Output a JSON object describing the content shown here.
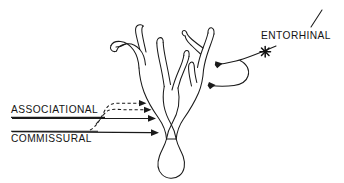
{
  "figure": {
    "background_color": "#ffffff",
    "ink_color": "#1a1a1a",
    "width": 344,
    "height": 183
  },
  "labels": {
    "associational": "ASSOCIATIONAL",
    "commissural": "COMMISSURAL",
    "entorhinal": "ENTORHINAL"
  },
  "diagram_data": {
    "type": "diagram",
    "subject": "neuron with dendritic tree and labeled afferent inputs",
    "cell_parts": [
      {
        "name": "soma",
        "description": "pear-shaped cell body at bottom center"
      },
      {
        "name": "apical-dendritic-tree",
        "description": "branching dendrites rising from soma, splitting into left and right primary branches with multiple bifurcations"
      }
    ],
    "afferents": [
      {
        "name": "associational",
        "label": "ASSOCIATIONAL",
        "side": "left",
        "line_style": "dashed-and-solid",
        "arrow_count": 3,
        "underline": true,
        "description": "dashed pathway plus solid pathway arriving at proximal dendrites"
      },
      {
        "name": "commissural",
        "label": "COMMISSURAL",
        "side": "left",
        "line_style": "solid",
        "arrow_count": 1,
        "underline": true,
        "description": "solid pathway arriving at most proximal dendrite just above soma"
      },
      {
        "name": "entorhinal",
        "label": "ENTORHINAL",
        "side": "right",
        "line_style": "solid-curved",
        "arrow_count": 2,
        "marker": "x-cross",
        "description": "two curved arrows from a common stem terminating on distal dendrites of the right branch"
      }
    ],
    "arrow_targets": [
      {
        "afferent": "associational",
        "x": 143,
        "y": 103
      },
      {
        "afferent": "associational",
        "x": 148,
        "y": 110
      },
      {
        "afferent": "associational",
        "x": 152,
        "y": 118
      },
      {
        "afferent": "commissural",
        "x": 155,
        "y": 133
      },
      {
        "afferent": "entorhinal",
        "x": 213,
        "y": 65
      },
      {
        "afferent": "entorhinal",
        "x": 206,
        "y": 85
      }
    ],
    "marker_position": {
      "x": 265,
      "y": 52,
      "glyph": "x-cross"
    }
  }
}
